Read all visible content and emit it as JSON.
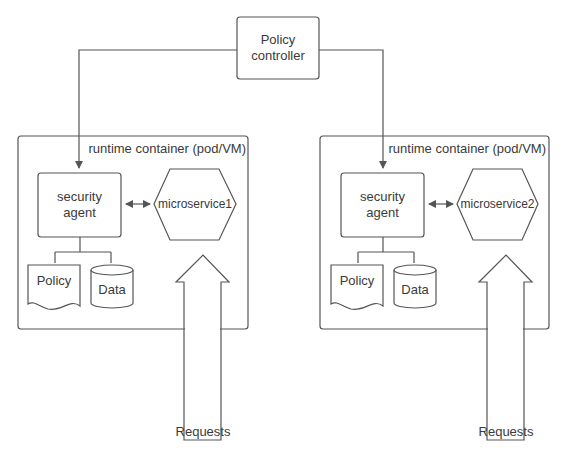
{
  "diagram": {
    "controller": {
      "label_line1": "Policy",
      "label_line2": "controller"
    },
    "containers": [
      {
        "title": "runtime container (pod/VM)",
        "agent": {
          "label_line1": "security",
          "label_line2": "agent"
        },
        "service": "microservice1",
        "policy": "Policy",
        "data": "Data",
        "requests": "Requests"
      },
      {
        "title": "runtime container (pod/VM)",
        "agent": {
          "label_line1": "security",
          "label_line2": "agent"
        },
        "service": "microservice2",
        "policy": "Policy",
        "data": "Data",
        "requests": "Requests"
      }
    ],
    "colors": {
      "stroke": "#555555",
      "background": "#ffffff",
      "text": "#3a3a3a"
    }
  }
}
